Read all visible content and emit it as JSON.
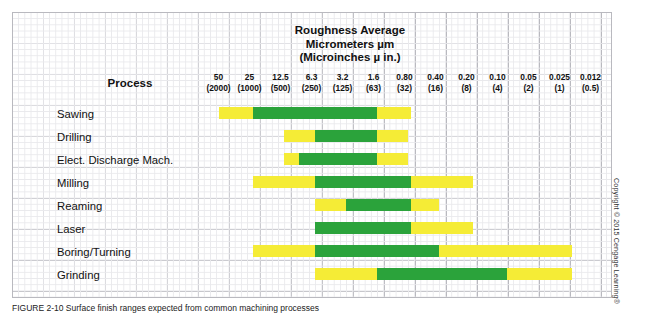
{
  "figure": {
    "title_lines": "Roughness Average\nMicrometers µm\n(Microinches µ in.)",
    "process_header": "Process",
    "copyright": "Copyright © 2015 Cengage Learning®",
    "caption": "FIGURE 2-10 Surface finish ranges expected from common machining processes"
  },
  "colors": {
    "typical_range": "#2ba33b",
    "possible_range": "#f5ec36",
    "grid_minor": "#e9e9ec",
    "grid_major": "#b9b9bf"
  },
  "chart_data": {
    "type": "bar",
    "title": "Roughness Average Micrometers µm (Microinches µ in.)",
    "xlabel": "Roughness Average Micrometers µm (Microinches µ in.)",
    "ylabel": "Process",
    "orientation": "horizontal",
    "grid": true,
    "legend": [],
    "axis_micrometers": [
      "50",
      "25",
      "12.5",
      "6.3",
      "3.2",
      "1.6",
      "0.80",
      "0.40",
      "0.20",
      "0.10",
      "0.05",
      "0.025",
      "0.012"
    ],
    "axis_microinches": [
      "(2000)",
      "(1000)",
      "(500)",
      "(250)",
      "(125)",
      "(63)",
      "(32)",
      "(16)",
      "(8)",
      "(4)",
      "(2)",
      "(1)",
      "(0.5)"
    ],
    "categories": [
      "Sawing",
      "Drilling",
      "Elect. Discharge Mach.",
      "Milling",
      "Reaming",
      "Laser",
      "Boring/Turning",
      "Grinding"
    ],
    "series": [
      {
        "name": "Sawing",
        "less_frequent_start_col": 0.5,
        "typical_start_col": 1.6,
        "typical_end_col": 5.6,
        "less_frequent_end_col": 6.7,
        "range_um_less_frequent": "50 – 0.80",
        "range_um_typical": "25 – 1.6"
      },
      {
        "name": "Drilling",
        "less_frequent_start_col": 2.6,
        "typical_start_col": 3.6,
        "typical_end_col": 5.6,
        "less_frequent_end_col": 6.6,
        "range_um_less_frequent": "12.5 – 0.80",
        "range_um_typical": "6.3 – 1.6"
      },
      {
        "name": "Elect. Discharge Mach.",
        "less_frequent_start_col": 2.6,
        "typical_start_col": 3.1,
        "typical_end_col": 5.6,
        "less_frequent_end_col": 6.6,
        "range_um_less_frequent": "12.5 – 0.80",
        "range_um_typical": "12.5 – 1.6"
      },
      {
        "name": "Milling",
        "less_frequent_start_col": 1.6,
        "typical_start_col": 3.6,
        "typical_end_col": 6.7,
        "less_frequent_end_col": 8.7,
        "range_um_less_frequent": "25 – 0.20",
        "range_um_typical": "6.3 – 0.80"
      },
      {
        "name": "Reaming",
        "less_frequent_start_col": 3.6,
        "typical_start_col": 4.6,
        "typical_end_col": 6.7,
        "less_frequent_end_col": 7.6,
        "range_um_less_frequent": "6.3 – 0.40",
        "range_um_typical": "3.2 – 0.80"
      },
      {
        "name": "Laser",
        "less_frequent_start_col": 3.6,
        "typical_start_col": 3.6,
        "typical_end_col": 6.7,
        "less_frequent_end_col": 8.7,
        "range_um_less_frequent": "6.3 – 0.20",
        "range_um_typical": "6.3 – 0.80"
      },
      {
        "name": "Boring/Turning",
        "less_frequent_start_col": 1.6,
        "typical_start_col": 3.6,
        "typical_end_col": 7.6,
        "less_frequent_end_col": 11.9,
        "range_um_less_frequent": "25 – 0.025",
        "range_um_typical": "6.3 – 0.40"
      },
      {
        "name": "Grinding",
        "less_frequent_start_col": 3.6,
        "typical_start_col": 5.6,
        "typical_end_col": 9.8,
        "less_frequent_end_col": 11.9,
        "range_um_less_frequent": "6.3 – 0.025",
        "range_um_typical": "1.6 – 0.10"
      }
    ]
  }
}
